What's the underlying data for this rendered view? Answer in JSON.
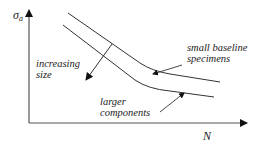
{
  "diagram": {
    "y_axis": {
      "label": "σ",
      "subscript": "a"
    },
    "x_axis": {
      "label": "N"
    },
    "curves": [
      {
        "name": "small-baseline-curve",
        "label_line1": "small baseline",
        "label_line2": "specimens"
      },
      {
        "name": "larger-components-curve",
        "label_line1": "larger",
        "label_line2": "components"
      }
    ],
    "arrow_annotation": {
      "label_line1": "increasing",
      "label_line2": "size"
    },
    "colors": {
      "line": "#333333",
      "background": "#ffffff"
    }
  }
}
